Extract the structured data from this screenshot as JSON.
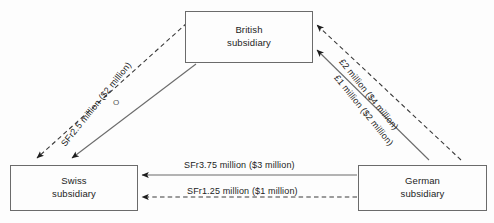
{
  "diagram": {
    "type": "flow-diagram",
    "background_color": "#fdfdfd",
    "line_color": "#6b6b6b",
    "text_color": "#232323",
    "nodes": [
      {
        "id": "british",
        "line1": "British",
        "line2": "subsidiary",
        "position": "top-center"
      },
      {
        "id": "swiss",
        "line1": "Swiss",
        "line2": "subsidiary",
        "position": "bottom-left"
      },
      {
        "id": "german",
        "line1": "German",
        "line2": "subsidiary",
        "position": "bottom-right"
      }
    ],
    "edges": [
      {
        "id": "british-to-swiss-dashed",
        "from": "british",
        "to": "swiss",
        "style": "dashed",
        "label": "SFr2.5 million ($2 million)",
        "arrow": "to-swiss"
      },
      {
        "id": "british-to-swiss-solid",
        "from": "british",
        "to": "swiss",
        "style": "solid",
        "label": "",
        "arrow": "to-swiss"
      },
      {
        "id": "german-to-british-dashed",
        "from": "german",
        "to": "british",
        "style": "dashed",
        "label": "£2 million ($4 million)",
        "arrow": "to-british"
      },
      {
        "id": "german-to-british-solid",
        "from": "german",
        "to": "british",
        "style": "solid",
        "label": "£1 million ($2 million)",
        "arrow": "to-british"
      },
      {
        "id": "german-to-swiss-solid",
        "from": "german",
        "to": "swiss",
        "style": "solid",
        "label": "SFr3.75 million ($3 million)",
        "arrow": "to-swiss"
      },
      {
        "id": "german-to-swiss-dashed",
        "from": "german",
        "to": "swiss",
        "style": "dashed",
        "label": "SFr1.25 million ($1 million)",
        "arrow": "to-swiss"
      }
    ],
    "artifacts": {
      "stray_mark": "O"
    }
  }
}
